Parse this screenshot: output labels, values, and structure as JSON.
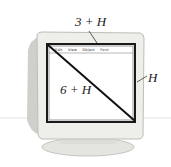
{
  "figure": {
    "labels": {
      "width": "3 + H",
      "height": "H",
      "diagonal": "6 + H"
    },
    "menu_bar": [
      "Edit",
      "View",
      "Object",
      "Font"
    ],
    "colors": {
      "bezel": "#e9e9e6",
      "bezel_shadow": "#c9c9c5",
      "screen": "#ffffff",
      "screen_frame": "#1a1a1a",
      "ink": "#222222"
    }
  }
}
